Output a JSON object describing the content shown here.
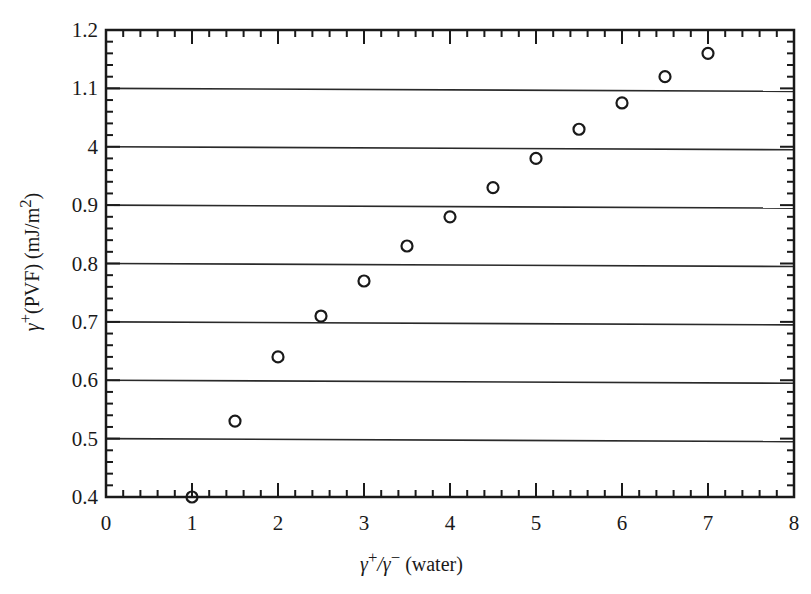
{
  "chart_data": {
    "type": "scatter",
    "title": "",
    "xlabel": "γ⁺/γ⁻ (water)",
    "ylabel": "γ⁺(PVF) (mJ/m²)",
    "xlim": [
      0,
      8
    ],
    "ylim": [
      0.4,
      1.2
    ],
    "x_ticks": [
      "0",
      "1",
      "2",
      "3",
      "4",
      "5",
      "6",
      "7",
      "8"
    ],
    "y_ticks": [
      "0.4",
      "0.5",
      "0.6",
      "0.7",
      "0.8",
      "0.9",
      "4",
      "1.1",
      "1.2"
    ],
    "y_tick_note": "The tick label at 1.0 is printed as '4' in the original figure",
    "grid": {
      "horizontal": true,
      "vertical": false
    },
    "marker": "open-circle",
    "legend": null,
    "series": [
      {
        "name": "γ⁺(PVF)",
        "x": [
          1,
          1.5,
          2,
          2.5,
          3,
          3.5,
          4,
          4.5,
          5,
          5.5,
          6,
          6.5,
          7
        ],
        "y": [
          0.4,
          0.53,
          0.64,
          0.71,
          0.77,
          0.83,
          0.88,
          0.93,
          0.98,
          1.03,
          1.075,
          1.12,
          1.16
        ]
      }
    ]
  },
  "labels": {
    "x_title_prefix": "γ",
    "x_title_sup1": "+",
    "x_title_mid": "/γ",
    "x_title_sup2": "−",
    "x_title_suffix": " (water)",
    "y_title_prefix": "γ",
    "y_title_sup1": "+",
    "y_title_mid": "(PVF) (mJ/m",
    "y_title_sup2": "2",
    "y_title_suffix": ")"
  }
}
